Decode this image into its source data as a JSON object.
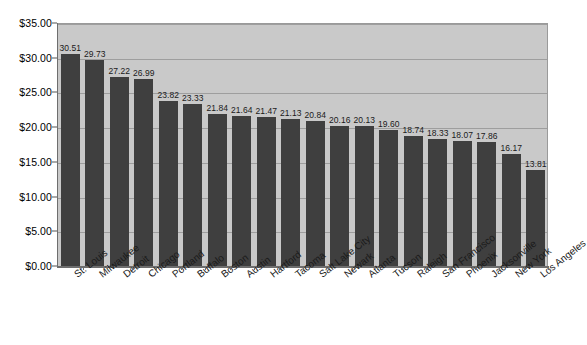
{
  "chart_data": {
    "type": "bar",
    "title": "",
    "subtitle": "",
    "xlabel": "",
    "ylabel": "",
    "ylim": [
      0,
      35
    ],
    "ytick_step": 5,
    "grid": true,
    "legend": false,
    "value_labels": true,
    "value_label_format": "2-decimal",
    "bar_color": "#3f3f3f",
    "plot_background": "#c9c9c9",
    "page_background": "#ffffff",
    "ytick_labels": [
      "$0.00",
      "$5.00",
      "$10.00",
      "$15.00",
      "$20.00",
      "$25.00",
      "$30.00",
      "$35.00"
    ],
    "ytick_values": [
      0,
      5,
      10,
      15,
      20,
      25,
      30,
      35
    ],
    "categories": [
      "St. Louis",
      "Milwaukee",
      "Detroit",
      "Chicago",
      "Portland",
      "Buffalo",
      "Boston",
      "Austin",
      "Hartford",
      "Tacoma",
      "Salt Lake City",
      "Newark",
      "Atlanta",
      "Tucson",
      "Raleigh",
      "San Francisco",
      "Phoenix",
      "Jacksonville",
      "New York",
      "Los Angeles"
    ],
    "values": [
      30.51,
      29.73,
      27.22,
      26.99,
      23.82,
      23.33,
      21.84,
      21.64,
      21.47,
      21.13,
      20.84,
      20.16,
      20.13,
      19.6,
      18.74,
      18.33,
      18.07,
      17.86,
      16.17,
      13.81
    ],
    "value_labels_text": [
      "30.51",
      "29.73",
      "27.22",
      "26.99",
      "23.82",
      "23.33",
      "21.84",
      "21.64",
      "21.47",
      "21.13",
      "20.84",
      "20.16",
      "20.13",
      "19.60",
      "18.74",
      "18.33",
      "18.07",
      "17.86",
      "16.17",
      "13.81"
    ]
  }
}
